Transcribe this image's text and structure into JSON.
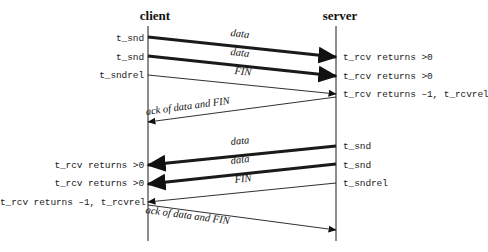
{
  "diagram": {
    "title_visible": false,
    "headers": [
      {
        "name": "client-header",
        "label": "client",
        "x": 155,
        "y": 8
      },
      {
        "name": "server-header",
        "label": "server",
        "x": 340,
        "y": 8
      }
    ],
    "lifelines": [
      {
        "name": "client-lifeline",
        "x": 148,
        "y1": 26,
        "y2": 241
      },
      {
        "name": "server-lifeline",
        "x": 336,
        "y1": 26,
        "y2": 241
      }
    ],
    "left_labels": [
      {
        "name": "left-label-t-snd-1",
        "text": "t_snd",
        "x_right": 144,
        "y": 33
      },
      {
        "name": "left-label-t-snd-2",
        "text": "t_snd",
        "x_right": 144,
        "y": 52
      },
      {
        "name": "left-label-t-sndrel",
        "text": "t_sndrel",
        "x_right": 144,
        "y": 70
      },
      {
        "name": "left-label-t-rcv-1",
        "text": "t_rcv returns >0",
        "x_right": 144,
        "y": 160
      },
      {
        "name": "left-label-t-rcv-2",
        "text": "t_rcv returns >0",
        "x_right": 144,
        "y": 178
      },
      {
        "name": "left-label-t-rcv-rel",
        "text": "t_rcv returns –1, t_rcvrel",
        "x_right": 144,
        "y": 197
      }
    ],
    "right_labels": [
      {
        "name": "right-label-t-rcv-1",
        "text": "t_rcv returns >0",
        "x_left": 343,
        "y": 52
      },
      {
        "name": "right-label-t-rcv-2",
        "text": "t_rcv returns >0",
        "x_left": 343,
        "y": 71
      },
      {
        "name": "right-label-t-rcv-rel",
        "text": "t_rcv returns –1, t_rcvrel",
        "x_left": 343,
        "y": 89
      },
      {
        "name": "right-label-t-snd-1",
        "text": "t_snd",
        "x_left": 343,
        "y": 141
      },
      {
        "name": "right-label-t-snd-2",
        "text": "t_snd",
        "x_left": 343,
        "y": 160
      },
      {
        "name": "right-label-t-sndrel",
        "text": "t_sndrel",
        "x_left": 343,
        "y": 178
      }
    ],
    "messages": [
      {
        "name": "message-data-c2s-1",
        "label": "data",
        "direction": "client-to-server",
        "weight": "thick",
        "x1": 148,
        "y1": 37,
        "x2": 336,
        "y2": 57,
        "label_x": 240,
        "label_y": 38,
        "label_rotation": 6.1
      },
      {
        "name": "message-data-c2s-2",
        "label": "data",
        "direction": "client-to-server",
        "weight": "thick",
        "x1": 148,
        "y1": 56,
        "x2": 336,
        "y2": 76,
        "label_x": 240,
        "label_y": 57,
        "label_rotation": 6.1
      },
      {
        "name": "message-fin-c2s",
        "label": "FIN",
        "direction": "client-to-server",
        "weight": "thin",
        "x1": 148,
        "y1": 75,
        "x2": 336,
        "y2": 94,
        "label_x": 243,
        "label_y": 76,
        "label_rotation": 5.8
      },
      {
        "name": "message-ack-s2c",
        "label": "ack of data and FIN",
        "direction": "server-to-client",
        "weight": "thin",
        "x1": 336,
        "y1": 97,
        "x2": 148,
        "y2": 122,
        "label_x": 188,
        "label_y": 117,
        "label_rotation": -7.6
      },
      {
        "name": "message-data-s2c-1",
        "label": "data",
        "direction": "server-to-client",
        "weight": "thick",
        "x1": 336,
        "y1": 146,
        "x2": 148,
        "y2": 165,
        "label_x": 240,
        "label_y": 147,
        "label_rotation": -5.8
      },
      {
        "name": "message-data-s2c-2",
        "label": "data",
        "direction": "server-to-client",
        "weight": "thick",
        "x1": 336,
        "y1": 164,
        "x2": 148,
        "y2": 184,
        "label_x": 240,
        "label_y": 166,
        "label_rotation": -6.1
      },
      {
        "name": "message-fin-s2c",
        "label": "FIN",
        "direction": "server-to-client",
        "weight": "thin",
        "x1": 336,
        "y1": 183,
        "x2": 148,
        "y2": 202,
        "label_x": 243,
        "label_y": 185,
        "label_rotation": -5.8
      },
      {
        "name": "message-ack-c2s",
        "label": "ack of data and FIN",
        "direction": "client-to-server",
        "weight": "thin",
        "x1": 148,
        "y1": 205,
        "x2": 336,
        "y2": 230,
        "label_x": 188,
        "label_y": 215,
        "label_rotation": 7.6
      }
    ],
    "colors": {
      "background": "#ffffff",
      "line": "#1a1a1a",
      "text": "#111111"
    }
  }
}
